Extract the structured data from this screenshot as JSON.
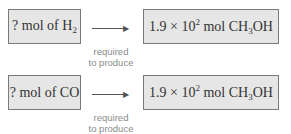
{
  "rows": [
    {
      "left_box": {
        "prefix": "? mol of H",
        "sub": "2",
        "suffix": ""
      },
      "arrow_label_line1": "required",
      "arrow_label_line2": "to produce",
      "right_box": {
        "coef": "1.9 × 10",
        "exp": "2",
        "unit": " mol CH",
        "sub": "3",
        "tail": "OH"
      }
    },
    {
      "left_box": {
        "prefix": "? mol of CO",
        "sub": "",
        "suffix": ""
      },
      "arrow_label_line1": "required",
      "arrow_label_line2": "to produce",
      "right_box": {
        "coef": "1.9 × 10",
        "exp": "2",
        "unit": " mol CH",
        "sub": "3",
        "tail": "OH"
      }
    }
  ],
  "colors": {
    "box_fill": "#e6e6e6",
    "box_border": "#7a7a7a",
    "label": "#8a8a8a"
  }
}
